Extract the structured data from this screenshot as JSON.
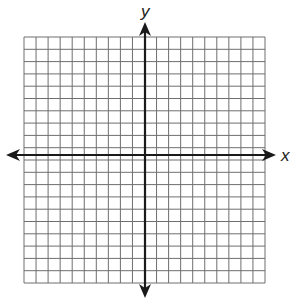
{
  "chart_data": {
    "type": "coordinate-grid",
    "title": "",
    "xlabel": "x",
    "ylabel": "y",
    "grid": true,
    "grid_columns": 20,
    "grid_rows": 20,
    "xlim": [
      -10,
      10
    ],
    "ylim": [
      -10,
      10
    ],
    "tick_labels": [],
    "series": []
  },
  "axes": {
    "x_label": "x",
    "y_label": "y"
  },
  "layout": {
    "grid_left": 24,
    "grid_top": 37,
    "grid_right": 265,
    "grid_bottom": 283,
    "origin_x": 145,
    "origin_y": 155,
    "x_axis_start": 6,
    "x_axis_end": 276,
    "y_axis_start": 22,
    "y_axis_end": 298
  },
  "colors": {
    "grid_line": "#6e6e6e",
    "axis_line": "#1a1a1a",
    "background": "#ffffff"
  }
}
